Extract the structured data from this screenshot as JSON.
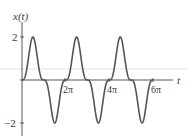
{
  "chart_data": {
    "type": "line",
    "title": "",
    "xlabel": "t",
    "ylabel": "x(t)",
    "function": "2 sin^3(t)",
    "xlim": [
      0,
      6.6
    ],
    "xlim_units": "pi",
    "ylim": [
      -2.3,
      2.6
    ],
    "x_ticks": [
      {
        "value": 6.283,
        "label": "2π"
      },
      {
        "value": 12.566,
        "label": "4π"
      },
      {
        "value": 18.85,
        "label": "6π"
      }
    ],
    "y_ticks": [
      {
        "value": 2,
        "label": "2"
      },
      {
        "value": -2,
        "label": "−2"
      }
    ],
    "grid": false,
    "legend": null,
    "series": [
      {
        "name": "x(t)",
        "color": "#555555",
        "x": [
          0,
          0.785,
          1.571,
          2.356,
          3.142,
          3.927,
          4.712,
          5.498,
          6.283,
          7.069,
          7.854,
          8.639,
          9.425,
          10.21,
          10.996,
          11.781,
          12.566,
          13.352,
          14.137,
          14.923,
          15.708,
          16.493,
          17.279,
          18.064,
          18.85
        ],
        "values": [
          0,
          0.71,
          2,
          0.71,
          0,
          -0.71,
          -2,
          -0.71,
          0,
          0.71,
          2,
          0.71,
          0,
          -0.71,
          -2,
          -0.71,
          0,
          0.71,
          2,
          0.71,
          0,
          -0.71,
          -2,
          -0.71,
          0
        ]
      }
    ]
  },
  "labels": {
    "ylabel": "x(t)",
    "xlabel": "t",
    "ytick_pos": "2",
    "ytick_neg": "−2",
    "xtick_2pi": "2π",
    "xtick_4pi": "4π",
    "xtick_6pi": "6π"
  },
  "colors": {
    "axis": "#555555",
    "curve": "#555555",
    "text": "#3a3a3a"
  }
}
